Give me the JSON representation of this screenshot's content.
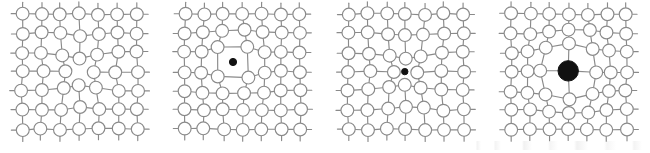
{
  "figure": {
    "panel_count": 4,
    "width": 650,
    "height": 153,
    "background_color": "#ffffff"
  },
  "style": {
    "atom_stroke_color": "#8a8a8a",
    "atom_fill_color": "#ffffff",
    "bond_color": "#8a8a8a",
    "defect_color": "#111111",
    "atom_radius": 6.4,
    "bond_width": 1.15
  },
  "lattice": {
    "rows": 7,
    "columns": 7,
    "spacing": 19.2,
    "origin_x": 22,
    "origin_y": 14
  },
  "panels": [
    {
      "name": "vacancy",
      "label": "Vacancy",
      "description": "Lattice site is empty; neighbouring atoms relax inward toward the missing site.",
      "x_offset": 0,
      "defect": {
        "type": "vacancy",
        "site_row": 3,
        "site_col": 3,
        "marker_visible": false,
        "marker_radius": 0,
        "relaxation": -0.28,
        "relaxation_range": 2.1
      }
    },
    {
      "name": "interstitial",
      "label": "Interstitial",
      "description": "A small atom occupies an interstitial cage between lattice sites; the cage atoms are pushed apart.",
      "x_offset": 163,
      "defect": {
        "type": "interstitial",
        "site_row": 2.5,
        "site_col": 2.5,
        "marker_visible": true,
        "marker_radius": 3.6,
        "relaxation": 0.3,
        "relaxation_range": 2.3
      }
    },
    {
      "name": "small-substitutional-impurity",
      "label": "Small substitutional impurity",
      "description": "An undersized foreign atom replaces a host atom; neighbours relax inward producing local compression.",
      "x_offset": 326,
      "defect": {
        "type": "substitutional-small",
        "site_row": 3,
        "site_col": 3,
        "marker_visible": true,
        "marker_radius": 3.2,
        "relaxation": -0.36,
        "relaxation_range": 2.4
      }
    },
    {
      "name": "large-substitutional-impurity",
      "label": "Large substitutional impurity",
      "description": "An oversized foreign atom replaces a host atom; neighbours are displaced outward producing local tension.",
      "x_offset": 489,
      "defect": {
        "type": "substitutional-large",
        "site_row": 3,
        "site_col": 3,
        "marker_visible": true,
        "marker_radius": 10.2,
        "relaxation": 0.44,
        "relaxation_range": 2.4
      }
    }
  ],
  "artifacts": {
    "scan_noise_visible": true,
    "scan_noise_note": "faint scanner speckle along the lower right edge"
  }
}
